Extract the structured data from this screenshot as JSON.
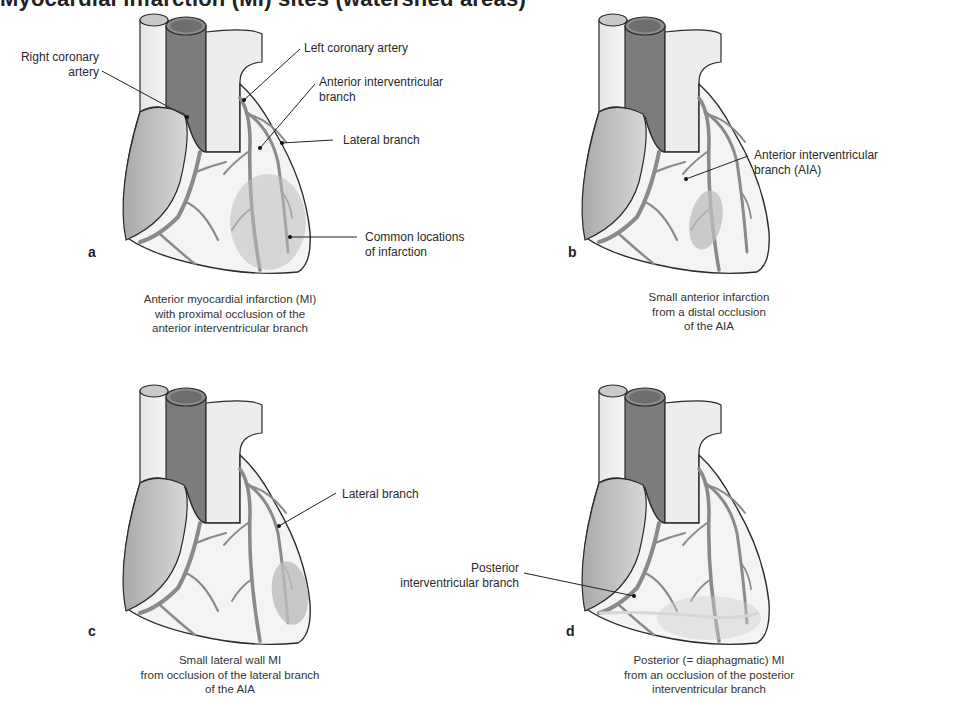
{
  "figure": {
    "heading_clipped": "Myocardial infarction (MI) sites (watershed areas)",
    "colors": {
      "myocardium": "#f4f4f4",
      "atrium": "#c9c9c9",
      "vessel_dark": "#8a8a8a",
      "aorta_inner": "#7c7c7c",
      "outline": "#2a2a2a",
      "infarct": "#bdbdbd",
      "text": "#2a2a2a"
    },
    "panels": [
      {
        "letter": "a",
        "labels": [
          "Right coronary artery",
          "Left coronary artery",
          "Anterior interventricular branch",
          "Lateral branch",
          "Common locations of infarction"
        ],
        "label_lines": {
          "rca": [
            "Right coronary",
            "artery"
          ],
          "lca": [
            "Left coronary artery"
          ],
          "aia": [
            "Anterior interventricular",
            "branch"
          ],
          "lateral": [
            "Lateral branch"
          ],
          "common": [
            "Common locations",
            "of infarction"
          ]
        },
        "caption": [
          "Anterior myocardial infarction (MI)",
          "with proximal occlusion of the",
          "anterior interventricular branch"
        ]
      },
      {
        "letter": "b",
        "label_lines": {
          "aia": [
            "Anterior interventricular",
            "branch (AIA)"
          ]
        },
        "caption": [
          "Small anterior infarction",
          "from a distal occlusion",
          "of the AIA"
        ]
      },
      {
        "letter": "c",
        "label_lines": {
          "lateral": [
            "Lateral branch"
          ]
        },
        "caption": [
          "Small lateral wall MI",
          "from occlusion of the lateral branch",
          "of the AIA"
        ]
      },
      {
        "letter": "d",
        "label_lines": {
          "posterior": [
            "Posterior",
            "interventricular branch"
          ]
        },
        "caption": [
          "Posterior (= diaphagmatic) MI",
          "from an occlusion of the posterior",
          "interventricular branch"
        ]
      }
    ]
  }
}
